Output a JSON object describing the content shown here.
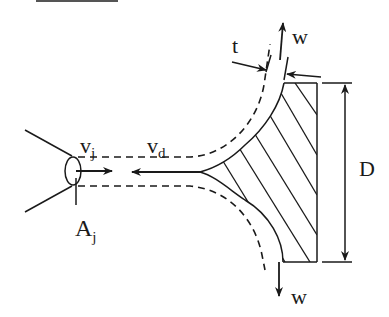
{
  "diagram": {
    "type": "impinging-jet-on-plate",
    "colors": {
      "stroke": "#1a1a1a",
      "background": "#ffffff"
    },
    "labels": {
      "jet_velocity": {
        "main": "v",
        "sub": "j"
      },
      "deflected_velocity": {
        "main": "v",
        "sub": "d"
      },
      "jet_area": {
        "main": "A",
        "sub": "j"
      },
      "sheet_thickness": "t",
      "flow_up": "w",
      "flow_down": "w",
      "plate_dimension": "D"
    }
  }
}
